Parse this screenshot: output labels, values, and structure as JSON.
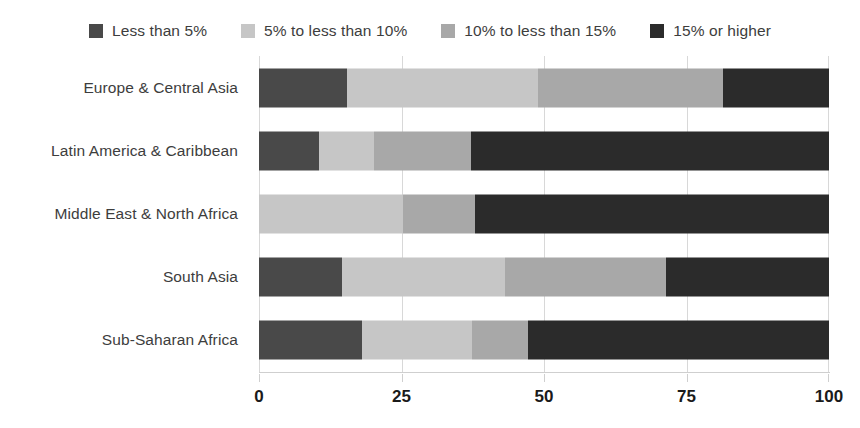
{
  "chart_data": {
    "type": "bar",
    "orientation": "horizontal",
    "stacked": true,
    "stack_total": 100,
    "title": "",
    "subtitle": "",
    "xlabel": "",
    "ylabel": "",
    "xlim": [
      0,
      100
    ],
    "xticks": [
      0,
      25,
      50,
      75,
      100
    ],
    "xtick_labels": [
      "0",
      "25",
      "50",
      "75",
      "100"
    ],
    "grid": true,
    "grid_axis": "x",
    "legend_position": "top-center",
    "categories": [
      "Europe & Central Asia",
      "Latin America & Caribbean",
      "Middle East & North Africa",
      "South Asia",
      "Sub-Saharan Africa"
    ],
    "series": [
      {
        "name": "Less than 5%",
        "color": "#494949",
        "values": [
          15.5,
          10.5,
          0.0,
          14.5,
          18.0
        ]
      },
      {
        "name": "5% to less than 10%",
        "color": "#c6c6c6",
        "values": [
          33.5,
          9.7,
          25.3,
          28.7,
          19.4
        ]
      },
      {
        "name": "10% to less than 15%",
        "color": "#a8a8a8",
        "values": [
          32.4,
          17.0,
          12.6,
          28.2,
          9.8
        ]
      },
      {
        "name": "15% or higher",
        "color": "#2b2b2b",
        "values": [
          18.6,
          62.8,
          62.1,
          28.6,
          52.8
        ]
      }
    ]
  },
  "legend": {
    "items": [
      {
        "label": "Less than 5%",
        "color": "#494949",
        "icon": "square-swatch-icon"
      },
      {
        "label": "5% to less than 10%",
        "color": "#c6c6c6",
        "icon": "square-swatch-icon"
      },
      {
        "label": "10% to less than 15%",
        "color": "#a8a8a8",
        "icon": "square-swatch-icon"
      },
      {
        "label": "15% or higher",
        "color": "#2b2b2b",
        "icon": "square-swatch-icon"
      }
    ]
  },
  "colors": {
    "background": "#ffffff",
    "gridline": "#d8d8d8",
    "axis_line": "#cfcfcf",
    "label_text": "#3d3d3d",
    "tick_text": "#1a1a1a"
  }
}
